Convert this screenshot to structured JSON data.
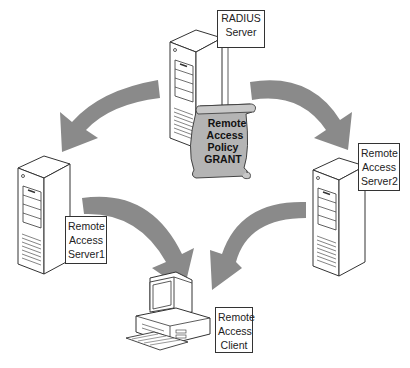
{
  "diagram": {
    "colors": {
      "arrow": "#8a8a8a",
      "scroll": "#b4b4b4",
      "outline": "#333333",
      "background": "#ffffff"
    },
    "nodes": [
      {
        "id": "radius",
        "label_lines": [
          "RADIUS",
          "Server"
        ],
        "icon": "server-tower-icon"
      },
      {
        "id": "ras1",
        "label_lines": [
          "Remote",
          "Access",
          "Server1"
        ],
        "icon": "server-tower-icon"
      },
      {
        "id": "ras2",
        "label_lines": [
          "Remote",
          "Access",
          "Server2"
        ],
        "icon": "server-tower-icon"
      },
      {
        "id": "client",
        "label_lines": [
          "Remote",
          "Access",
          "Client"
        ],
        "icon": "desktop-computer-icon"
      }
    ],
    "policy_scroll": {
      "lines": [
        "Remote",
        "Access",
        "Policy",
        "GRANT"
      ],
      "icon": "scroll-icon"
    },
    "arrows": [
      {
        "from": "radius",
        "to": "ras1"
      },
      {
        "from": "radius",
        "to": "ras2"
      },
      {
        "from": "ras1",
        "to": "client"
      },
      {
        "from": "ras2",
        "to": "client"
      }
    ]
  }
}
